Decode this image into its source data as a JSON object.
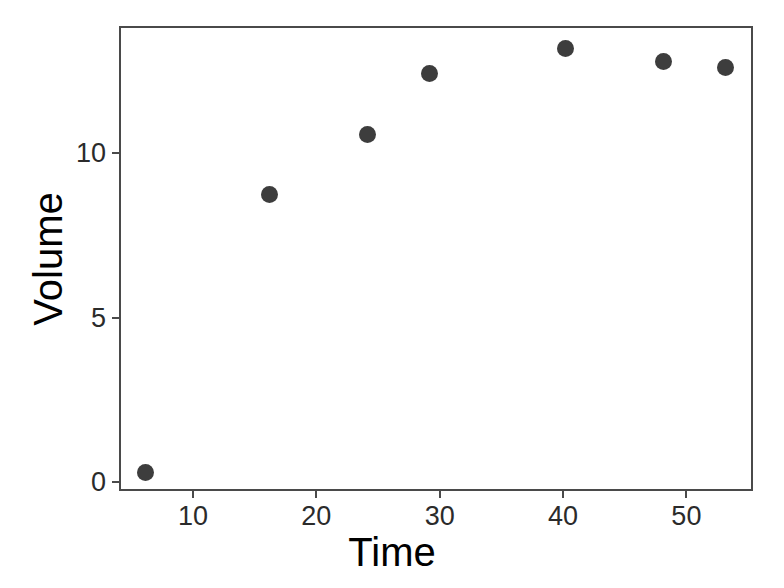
{
  "chart_data": {
    "type": "scatter",
    "title": "",
    "xlabel": "Time",
    "ylabel": "Volume",
    "xlim": [
      4.0,
      55.4
    ],
    "ylim": [
      -0.27,
      13.87
    ],
    "xticks": [
      10,
      20,
      30,
      40,
      50
    ],
    "xtick_labels": [
      "10",
      "20",
      "30",
      "40",
      "50"
    ],
    "yticks": [
      0,
      5,
      10
    ],
    "ytick_labels": [
      "0",
      "5",
      "10"
    ],
    "grid": false,
    "legend": null,
    "series": [
      {
        "name": "Volume vs Time",
        "marker": "filled-circle",
        "color": "#3d3d3d",
        "x": [
          6,
          16,
          24,
          29,
          40,
          48,
          53
        ],
        "y": [
          0.36,
          8.81,
          10.64,
          12.49,
          13.25,
          12.85,
          12.67
        ]
      }
    ],
    "points": [
      {
        "x": 6,
        "y": 0.36
      },
      {
        "x": 16,
        "y": 8.81
      },
      {
        "x": 24,
        "y": 10.64
      },
      {
        "x": 29,
        "y": 12.49
      },
      {
        "x": 40,
        "y": 13.25
      },
      {
        "x": 48,
        "y": 12.85
      },
      {
        "x": 53,
        "y": 12.67
      }
    ]
  },
  "style": {
    "panel_border_color": "#4a4a4a",
    "background": "#ffffff",
    "point_color": "#3d3d3d",
    "tick_label_color": "#2b2b2b",
    "axis_title_color": "#000000"
  }
}
